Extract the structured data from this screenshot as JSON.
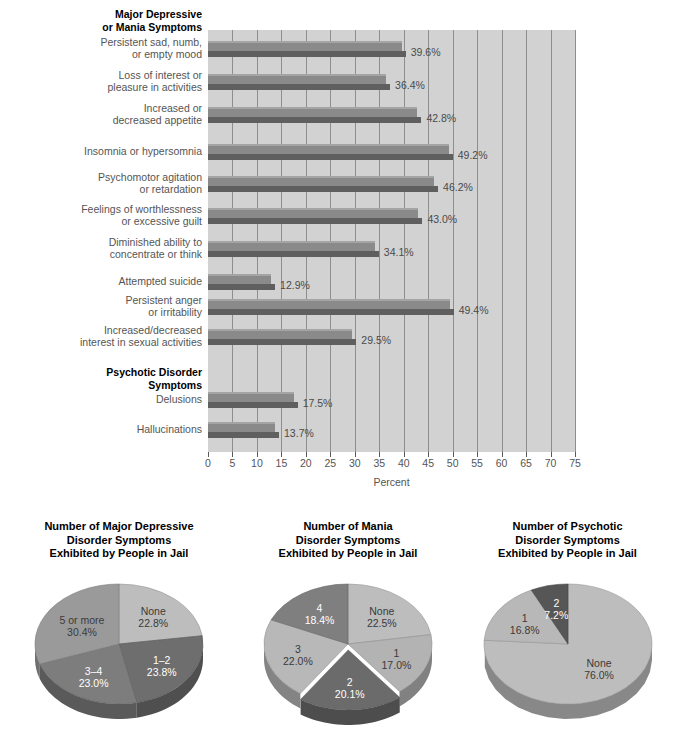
{
  "chart_data": [
    {
      "type": "bar",
      "title": "",
      "xlabel": "Percent",
      "ylabel": "",
      "xlim": [
        0,
        75
      ],
      "xticks": [
        0,
        5,
        10,
        15,
        20,
        25,
        30,
        35,
        40,
        45,
        50,
        55,
        60,
        65,
        70,
        75
      ],
      "grid": true,
      "orientation": "horizontal",
      "groups": [
        {
          "heading": "Major Depressive\nor Mania Symptoms",
          "heading_lines": [
            "Major Depressive",
            "or Mania Symptoms"
          ]
        },
        {
          "heading": "Psychotic Disorder\nSymptoms",
          "heading_lines": [
            "Psychotic Disorder",
            "Symptoms"
          ]
        }
      ],
      "categories": [
        "Persistent sad, numb, or empty mood",
        "Loss of interest or pleasure in activities",
        "Increased or decreased appetite",
        "Insomnia or hypersomnia",
        "Psychomotor agitation or retardation",
        "Feelings of worthlessness or excessive guilt",
        "Diminished ability to concentrate or think",
        "Attempted suicide",
        "Persistent anger or irritability",
        "Increased/decreased interest in sexual activities",
        "Delusions",
        "Hallucinations"
      ],
      "values": [
        39.6,
        36.4,
        42.8,
        49.2,
        46.2,
        43.0,
        34.1,
        12.9,
        49.4,
        29.5,
        17.5,
        13.7
      ],
      "value_labels": [
        "39.6%",
        "36.4%",
        "42.8%",
        "49.2%",
        "46.2%",
        "43.0%",
        "34.1%",
        "12.9%",
        "49.4%",
        "29.5%",
        "17.5%",
        "13.7%"
      ]
    },
    {
      "type": "pie",
      "title": "Number of Major Depressive Disorder Symptoms Exhibited by People in Jail",
      "title_lines": [
        "Number of Major Depressive",
        "Disorder Symptoms",
        "Exhibited by People in Jail"
      ],
      "categories": [
        "None",
        "1–2",
        "3–4",
        "5 or more"
      ],
      "values": [
        22.8,
        23.8,
        23.0,
        30.4
      ],
      "value_labels": [
        "22.8%",
        "23.8%",
        "23.0%",
        "30.4%"
      ],
      "colors": [
        "#bdbdbd",
        "#6e6e6e",
        "#7d7d7d",
        "#9a9a9a"
      ],
      "exploded": []
    },
    {
      "type": "pie",
      "title": "Number of Mania Disorder Symptoms Exhibited by People in Jail",
      "title_lines": [
        "Number of Mania",
        "Disorder Symptoms",
        "Exhibited by People in Jail"
      ],
      "categories": [
        "None",
        "1",
        "2",
        "3",
        "4"
      ],
      "values": [
        22.5,
        17.0,
        20.1,
        22.0,
        18.4
      ],
      "value_labels": [
        "22.5%",
        "17.0%",
        "20.1%",
        "22.0%",
        "18.4%"
      ],
      "colors": [
        "#bdbdbd",
        "#b3b3b3",
        "#6b6b6b",
        "#b8b8b8",
        "#7f7f7f"
      ],
      "exploded": [
        "2"
      ]
    },
    {
      "type": "pie",
      "title": "Number of Psychotic Disorder Symptoms Exhibited by People in Jail",
      "title_lines": [
        "Number of Psychotic",
        "Disorder Symptoms",
        "Exhibited by People in Jail"
      ],
      "categories": [
        "None",
        "1",
        "2"
      ],
      "values": [
        76.0,
        16.8,
        7.2
      ],
      "value_labels": [
        "76.0%",
        "16.8%",
        "7.2%"
      ],
      "colors": [
        "#bdbdbd",
        "#b8b8b8",
        "#565656"
      ],
      "exploded": []
    }
  ],
  "bar_chart": {
    "group1_heading_line1": "Major Depressive",
    "group1_heading_line2": "or Mania Symptoms",
    "group2_heading_line1": "Psychotic Disorder",
    "group2_heading_line2": "Symptoms",
    "axis_title": "Percent",
    "rows": [
      {
        "label_line1": "Persistent sad, numb,",
        "label_line2": "or empty mood",
        "value": "39.6%"
      },
      {
        "label_line1": "Loss of interest or",
        "label_line2": "pleasure in activities",
        "value": "36.4%"
      },
      {
        "label_line1": "Increased or",
        "label_line2": "decreased appetite",
        "value": "42.8%"
      },
      {
        "label_line1": "Insomnia or hypersomnia",
        "label_line2": "",
        "value": "49.2%"
      },
      {
        "label_line1": "Psychomotor agitation",
        "label_line2": "or retardation",
        "value": "46.2%"
      },
      {
        "label_line1": "Feelings of worthlessness",
        "label_line2": "or excessive guilt",
        "value": "43.0%"
      },
      {
        "label_line1": "Diminished ability to",
        "label_line2": "concentrate or think",
        "value": "34.1%"
      },
      {
        "label_line1": "Attempted suicide",
        "label_line2": "",
        "value": "12.9%"
      },
      {
        "label_line1": "Persistent anger",
        "label_line2": "or irritability",
        "value": "49.4%"
      },
      {
        "label_line1": "Increased/decreased",
        "label_line2": "interest in sexual activities",
        "value": "29.5%"
      },
      {
        "label_line1": "Delusions",
        "label_line2": "",
        "value": "17.5%"
      },
      {
        "label_line1": "Hallucinations",
        "label_line2": "",
        "value": "13.7%"
      }
    ],
    "xticks": [
      "0",
      "5",
      "10",
      "15",
      "20",
      "25",
      "30",
      "35",
      "40",
      "45",
      "50",
      "55",
      "60",
      "65",
      "70",
      "75"
    ]
  },
  "pies": [
    {
      "title_line1": "Number of Major Depressive",
      "title_line2": "Disorder Symptoms",
      "title_line3": "Exhibited by People in Jail",
      "slices": [
        {
          "name": "None",
          "pct": "22.8%"
        },
        {
          "name": "1–2",
          "pct": "23.8%"
        },
        {
          "name": "3–4",
          "pct": "23.0%"
        },
        {
          "name": "5 or more",
          "pct": "30.4%"
        }
      ]
    },
    {
      "title_line1": "Number of Mania",
      "title_line2": "Disorder Symptoms",
      "title_line3": "Exhibited by People in Jail",
      "slices": [
        {
          "name": "None",
          "pct": "22.5%"
        },
        {
          "name": "1",
          "pct": "17.0%"
        },
        {
          "name": "2",
          "pct": "20.1%"
        },
        {
          "name": "3",
          "pct": "22.0%"
        },
        {
          "name": "4",
          "pct": "18.4%"
        }
      ]
    },
    {
      "title_line1": "Number of Psychotic",
      "title_line2": "Disorder Symptoms",
      "title_line3": "Exhibited by People in Jail",
      "slices": [
        {
          "name": "None",
          "pct": "76.0%"
        },
        {
          "name": "1",
          "pct": "16.8%"
        },
        {
          "name": "2",
          "pct": "7.2%"
        }
      ]
    }
  ],
  "colors": {
    "plot_background": "#d2d2d2",
    "gridline": "#8e8e8e",
    "bar_face": "#8a8a8a",
    "bar_shadow": "#5f5f5f",
    "text": "#555555",
    "heading": "#000000"
  }
}
